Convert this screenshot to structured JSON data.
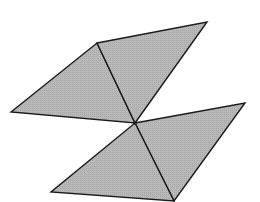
{
  "diagram": {
    "width": 260,
    "height": 202,
    "background": "#ffffff",
    "fill_color": "#b4b4b4",
    "stroke_color": "#1a1a1a",
    "stroke_width": 1.4,
    "center_point": [
      135,
      123
    ],
    "vertices": {
      "top_left": [
        97,
        43
      ],
      "top_right": [
        207,
        22
      ],
      "left": [
        11,
        112
      ],
      "center": [
        135,
        123
      ],
      "right": [
        245,
        103
      ],
      "bottom_left": [
        51,
        192
      ],
      "bottom": [
        174,
        201
      ]
    },
    "triangles": [
      {
        "name": "upper-left-triangle",
        "points": [
          [
            11,
            112
          ],
          [
            97,
            43
          ],
          [
            135,
            123
          ]
        ]
      },
      {
        "name": "upper-right-triangle",
        "points": [
          [
            97,
            43
          ],
          [
            207,
            22
          ],
          [
            135,
            123
          ]
        ]
      },
      {
        "name": "lower-right-triangle",
        "points": [
          [
            135,
            123
          ],
          [
            245,
            103
          ],
          [
            174,
            201
          ]
        ]
      },
      {
        "name": "lower-left-triangle",
        "points": [
          [
            135,
            123
          ],
          [
            174,
            201
          ],
          [
            51,
            192
          ]
        ]
      }
    ]
  }
}
